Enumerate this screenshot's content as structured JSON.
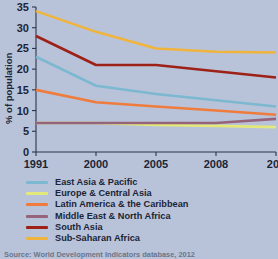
{
  "chart_data": {
    "type": "line",
    "title": "",
    "xlabel": "",
    "ylabel": "% of population",
    "x": [
      "1991",
      "2000",
      "2005",
      "2008",
      "201"
    ],
    "x_note": "last tick label clipped at right edge of image (2010)",
    "ylim": [
      0,
      35
    ],
    "yticks": [
      0,
      5,
      10,
      15,
      20,
      25,
      30,
      35
    ],
    "ytick_labels": [
      "0",
      "5",
      "10",
      "15",
      "20",
      "25",
      "30",
      "35"
    ],
    "grid": false,
    "legend_position": "below",
    "series": [
      {
        "name": "East Asia & Pacific",
        "color": "#7cb8cf",
        "values": [
          23,
          16,
          14,
          12.5,
          11
        ]
      },
      {
        "name": "Europe & Central Asia",
        "color": "#e3e87a",
        "values": [
          7,
          7,
          6.5,
          6.3,
          6
        ]
      },
      {
        "name": "Latin America & the Caribbean",
        "color": "#ef7c3c",
        "values": [
          15,
          12,
          11,
          10,
          9
        ]
      },
      {
        "name": "Middle East & North Africa",
        "color": "#96647a",
        "values": [
          7,
          7,
          7,
          7,
          8
        ]
      },
      {
        "name": "South Asia",
        "color": "#9e2118",
        "values": [
          28,
          21,
          21,
          19.5,
          18
        ]
      },
      {
        "name": "Sub-Saharan Africa",
        "color": "#f0b43c",
        "values": [
          34,
          29,
          25,
          24.2,
          24
        ]
      }
    ]
  },
  "figure": {
    "background_color": "#b8c3da",
    "axis_color": "#2b3347",
    "source_note": "Source: World Development Indicators database, 2012"
  }
}
